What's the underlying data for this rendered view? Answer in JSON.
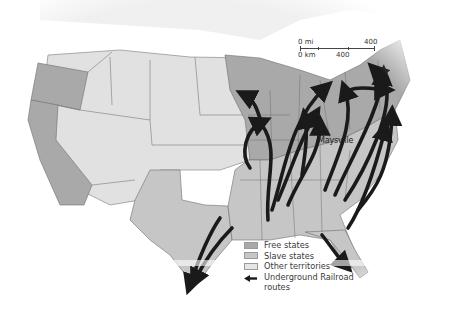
{
  "map": {
    "title": "Underground Railroad routes map",
    "colors": {
      "free_states": "#a9a9a9",
      "slave_states": "#c6c6c6",
      "other_territories": "#e1e1e1",
      "routes": "#1a1a1a",
      "borders": "#6e6e6e",
      "background": "#ffffff"
    }
  },
  "scale_bar": {
    "mi_zero": "0 mi",
    "mi_max": "400",
    "km_zero": "0 km",
    "km_max": "400"
  },
  "labels": {
    "city": "Maysville"
  },
  "legend": {
    "items": [
      {
        "label": "Free states",
        "swatch": "free_states"
      },
      {
        "label": "Slave states",
        "swatch": "slave_states"
      },
      {
        "label": "Other territories",
        "swatch": "other_territories"
      },
      {
        "label": "Underground Railroad",
        "label_line2": "routes",
        "swatch": "arrow"
      }
    ]
  }
}
